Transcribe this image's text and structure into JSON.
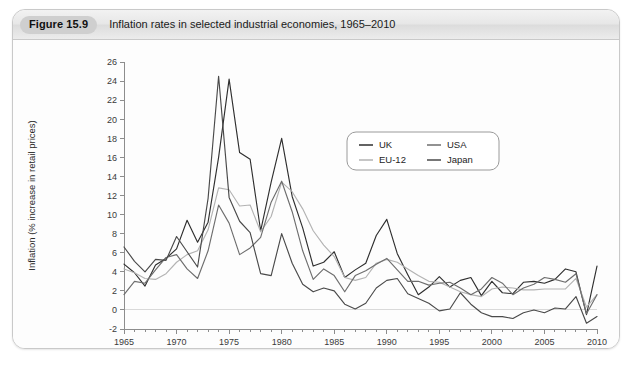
{
  "figure": {
    "badge_label": "Figure 15.9",
    "caption": "Inflation rates in selected industrial economies, 1965–2010"
  },
  "colors": {
    "uk": "#2f2f2f",
    "eu12": "#b3b3b3",
    "usa": "#6e6e6e",
    "japan": "#4a4a4a",
    "axis": "#8d8d8d",
    "zero_line": "#d9d9d9",
    "card_border": "#c9c9c9",
    "caption_bar": "#e7e7e7",
    "badge_bg": "#cfcfcf"
  },
  "legend": {
    "position": "inside-top-right",
    "entries": [
      {
        "label": "UK",
        "color": "#2f2f2f"
      },
      {
        "label": "USA",
        "color": "#6e6e6e"
      },
      {
        "label": "EU-12",
        "color": "#b3b3b3"
      },
      {
        "label": "Japan",
        "color": "#4a4a4a"
      }
    ]
  },
  "chart_data": {
    "type": "line",
    "title": "Inflation rates in selected industrial economies, 1965–2010",
    "xlabel": "",
    "ylabel": "Inflation (% increase in retail prices)",
    "xlim": [
      1965,
      2010
    ],
    "ylim": [
      -2,
      26
    ],
    "ytick_step": 2,
    "yticks": [
      -2,
      0,
      2,
      4,
      6,
      8,
      10,
      12,
      14,
      16,
      18,
      20,
      22,
      24,
      26
    ],
    "xticks": [
      1965,
      1970,
      1975,
      1980,
      1985,
      1990,
      1995,
      2000,
      2005,
      2010
    ],
    "xminor_step": 1,
    "grid": false,
    "zero_line": true,
    "legend_position": "upper right inside",
    "x": [
      1965,
      1966,
      1967,
      1968,
      1969,
      1970,
      1971,
      1972,
      1973,
      1974,
      1975,
      1976,
      1977,
      1978,
      1979,
      1980,
      1981,
      1982,
      1983,
      1984,
      1985,
      1986,
      1987,
      1988,
      1989,
      1990,
      1991,
      1992,
      1993,
      1994,
      1995,
      1996,
      1997,
      1998,
      1999,
      2000,
      2001,
      2002,
      2003,
      2004,
      2005,
      2006,
      2007,
      2008,
      2009,
      2010
    ],
    "series": [
      {
        "name": "UK",
        "color": "#2f2f2f",
        "values": [
          4.8,
          3.9,
          2.5,
          4.7,
          5.4,
          6.4,
          9.4,
          7.1,
          9.2,
          16.0,
          24.2,
          16.5,
          15.8,
          8.3,
          13.4,
          18.0,
          11.9,
          8.6,
          4.6,
          5.0,
          6.1,
          3.4,
          4.2,
          4.9,
          7.8,
          9.5,
          5.9,
          3.7,
          1.6,
          2.4,
          3.5,
          2.4,
          3.1,
          3.4,
          1.5,
          3.0,
          1.8,
          1.7,
          2.9,
          3.0,
          2.8,
          3.2,
          4.3,
          4.0,
          -0.5,
          4.6
        ]
      },
      {
        "name": "EU-12",
        "color": "#b3b3b3",
        "values": [
          4.3,
          3.9,
          3.3,
          3.2,
          3.8,
          5.0,
          5.8,
          6.2,
          8.4,
          12.8,
          12.6,
          10.9,
          11.0,
          8.2,
          9.8,
          13.4,
          12.4,
          10.6,
          8.3,
          6.8,
          5.6,
          3.4,
          3.1,
          3.4,
          4.9,
          5.3,
          5.0,
          4.3,
          3.6,
          3.0,
          2.9,
          2.4,
          1.9,
          1.6,
          1.4,
          2.2,
          2.4,
          2.3,
          2.1,
          2.1,
          2.2,
          2.2,
          2.2,
          3.3,
          0.3,
          1.6
        ]
      },
      {
        "name": "USA",
        "color": "#6e6e6e",
        "values": [
          1.6,
          3.0,
          2.8,
          4.2,
          5.5,
          5.8,
          4.3,
          3.3,
          6.2,
          11.0,
          9.1,
          5.8,
          6.5,
          7.6,
          11.3,
          13.5,
          10.3,
          6.2,
          3.2,
          4.3,
          3.6,
          1.9,
          3.6,
          4.1,
          4.8,
          5.4,
          4.2,
          3.0,
          3.0,
          2.6,
          2.8,
          2.9,
          2.3,
          1.6,
          2.2,
          3.4,
          2.8,
          1.6,
          2.3,
          2.7,
          3.4,
          3.2,
          2.9,
          3.8,
          -0.4,
          1.6
        ]
      },
      {
        "name": "Japan",
        "color": "#4a4a4a",
        "values": [
          6.6,
          5.1,
          4.0,
          5.3,
          5.2,
          7.7,
          6.1,
          4.5,
          11.7,
          24.5,
          11.8,
          9.3,
          8.1,
          3.8,
          3.6,
          8.0,
          4.9,
          2.7,
          1.9,
          2.3,
          2.0,
          0.6,
          0.1,
          0.7,
          2.3,
          3.1,
          3.3,
          1.7,
          1.2,
          0.7,
          -0.1,
          0.1,
          1.8,
          0.6,
          -0.3,
          -0.7,
          -0.7,
          -0.9,
          -0.3,
          0.0,
          -0.3,
          0.2,
          0.1,
          1.4,
          -1.4,
          -0.7
        ]
      }
    ]
  },
  "axes": {
    "y_title": "Inflation (% increase in retail prices)",
    "y_tick_labels": [
      "26",
      "24",
      "22",
      "20",
      "18",
      "16",
      "14",
      "12",
      "10",
      "8",
      "6",
      "4",
      "2",
      "0",
      "-2"
    ],
    "x_tick_labels": [
      "1965",
      "1970",
      "1975",
      "1980",
      "1985",
      "1990",
      "1995",
      "2000",
      "2005",
      "2010"
    ]
  }
}
